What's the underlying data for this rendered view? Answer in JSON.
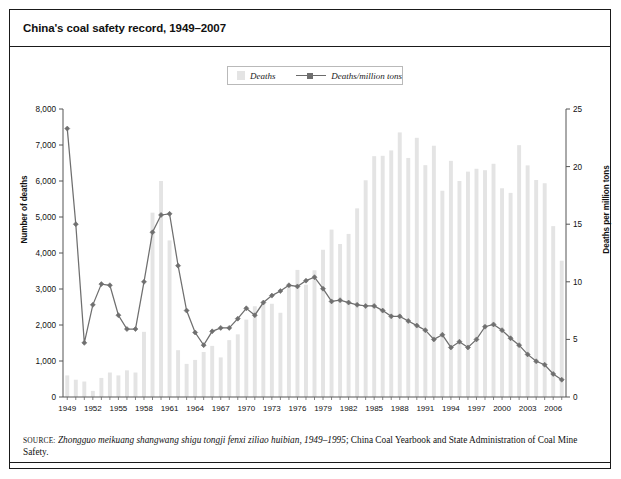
{
  "figure": {
    "title": "China's coal safety record, 1949–2007",
    "source_keyword": "SOURCE:",
    "source_italic": "Zhongguo meikuang shangwang shigu tongji fenxi ziliao huibian, 1949–1995",
    "source_rest": "; China Coal Yearbook and State Administration of Coal Mine Safety."
  },
  "legend": {
    "items": [
      {
        "label": "Deaths",
        "marker": "bar-swatch",
        "color": "#e4e4e4"
      },
      {
        "label": "Deaths/million tons",
        "marker": "line-with-square",
        "color": "#6f6f6f"
      }
    ]
  },
  "chart_data": {
    "type": "bar",
    "title": "China's coal safety record, 1949–2007",
    "xlabel": "",
    "ylabel": "Number of deaths",
    "y2label": "Deaths per million tons",
    "ylim": [
      0,
      8000
    ],
    "y2lim": [
      0,
      25
    ],
    "yticks": [
      "0",
      "1,000",
      "2,000",
      "3,000",
      "4,000",
      "5,000",
      "6,000",
      "7,000",
      "8,000"
    ],
    "ytick_values": [
      0,
      1000,
      2000,
      3000,
      4000,
      5000,
      6000,
      7000,
      8000
    ],
    "y2ticks": [
      "0",
      "5",
      "10",
      "15",
      "20",
      "25"
    ],
    "y2tick_values": [
      0,
      5,
      10,
      15,
      20,
      25
    ],
    "grid": false,
    "legend_position": "top-center",
    "x": [
      1949,
      1950,
      1951,
      1952,
      1953,
      1954,
      1955,
      1956,
      1957,
      1958,
      1959,
      1960,
      1961,
      1962,
      1963,
      1964,
      1965,
      1966,
      1967,
      1968,
      1969,
      1970,
      1971,
      1972,
      1973,
      1974,
      1975,
      1976,
      1977,
      1978,
      1979,
      1980,
      1981,
      1982,
      1983,
      1984,
      1985,
      1986,
      1987,
      1988,
      1989,
      1990,
      1991,
      1992,
      1993,
      1994,
      1995,
      1996,
      1997,
      1998,
      1999,
      2000,
      2001,
      2002,
      2003,
      2004,
      2005,
      2006,
      2007
    ],
    "xtick_labels": [
      "1949",
      "1952",
      "1955",
      "1958",
      "1961",
      "1964",
      "1967",
      "1970",
      "1973",
      "1976",
      "1979",
      "1982",
      "1985",
      "1988",
      "1991",
      "1994",
      "1997",
      "2000",
      "2003",
      "2006"
    ],
    "series": [
      {
        "name": "Deaths",
        "axis": "left",
        "units": "deaths",
        "color": "#e4e4e4",
        "values": [
          600,
          480,
          430,
          170,
          530,
          680,
          600,
          740,
          680,
          1810,
          5120,
          6000,
          4350,
          1300,
          920,
          1030,
          1250,
          1420,
          1100,
          1580,
          1740,
          2150,
          2520,
          2620,
          2590,
          2340,
          3080,
          3530,
          3120,
          3520,
          4090,
          4650,
          4250,
          4530,
          5240,
          6020,
          6690,
          6700,
          6850,
          7350,
          6640,
          7200,
          6440,
          6980,
          5730,
          6560,
          6000,
          6260,
          6340,
          6300,
          6478,
          5798,
          5670,
          6995,
          6434,
          6027,
          5938,
          4746,
          3786
        ]
      },
      {
        "name": "Deaths/million tons",
        "axis": "right",
        "units": "deaths per million tons",
        "color": "#6f6f6f",
        "values": [
          23.3,
          15.0,
          4.7,
          8.0,
          9.8,
          9.7,
          7.1,
          5.9,
          5.9,
          10.0,
          14.3,
          15.8,
          15.9,
          11.4,
          7.5,
          5.6,
          4.5,
          5.7,
          6.0,
          6.0,
          6.8,
          7.7,
          7.1,
          8.2,
          8.8,
          9.2,
          9.7,
          9.6,
          10.1,
          10.4,
          9.4,
          8.3,
          8.4,
          8.2,
          8.0,
          7.9,
          7.9,
          7.5,
          7.0,
          7.0,
          6.6,
          6.2,
          5.8,
          5.0,
          5.4,
          4.3,
          4.8,
          4.3,
          5.0,
          6.1,
          6.3,
          5.8,
          5.1,
          4.5,
          3.7,
          3.1,
          2.8,
          2.0,
          1.5
        ]
      }
    ]
  }
}
